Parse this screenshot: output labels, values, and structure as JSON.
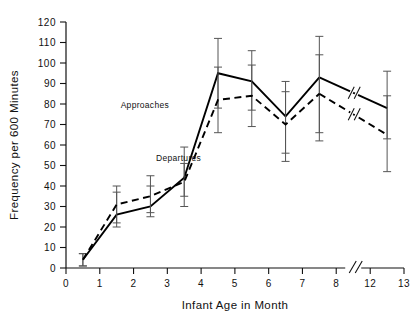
{
  "chart_data": {
    "type": "line",
    "title": "",
    "xlabel": "Infant Age in Month",
    "ylabel": "Frequency per 600 Minutes",
    "xlim": [
      0,
      13
    ],
    "ylim": [
      0,
      120
    ],
    "xticks": [
      "0",
      "1",
      "2",
      "3",
      "4",
      "5",
      "6",
      "7",
      "8",
      "12",
      "13"
    ],
    "xtick_values": [
      0,
      1,
      2,
      3,
      4,
      5,
      6,
      7,
      8,
      12,
      13
    ],
    "yticks": [
      "0",
      "10",
      "20",
      "30",
      "40",
      "50",
      "60",
      "70",
      "80",
      "90",
      "100",
      "110",
      "120"
    ],
    "ytick_values": [
      0,
      10,
      20,
      30,
      40,
      50,
      60,
      70,
      80,
      90,
      100,
      110,
      120
    ],
    "grid": false,
    "axis_break": {
      "after": 8,
      "before": 12,
      "label": "//"
    },
    "legend_position": "inline-annotation",
    "x": [
      0.5,
      1.5,
      2.5,
      3.5,
      4.5,
      5.5,
      6.5,
      7.5,
      12.5
    ],
    "series": [
      {
        "name": "Approaches",
        "style": "solid",
        "color": "#000000",
        "values": [
          4,
          26,
          30,
          44,
          95,
          91,
          74,
          93,
          78
        ],
        "err_low": [
          1,
          20,
          25,
          30,
          78,
          77,
          56,
          62,
          63
        ],
        "err_high": [
          7,
          37,
          40,
          59,
          112,
          106,
          91,
          113,
          96
        ]
      },
      {
        "name": "Departures",
        "style": "dashed",
        "color": "#000000",
        "values": [
          4,
          31,
          35,
          42,
          82,
          84,
          70,
          85,
          65
        ],
        "err_low": [
          1,
          22,
          27,
          35,
          66,
          69,
          52,
          66,
          47
        ],
        "err_high": [
          7,
          40,
          45,
          51,
          98,
          99,
          86,
          104,
          84
        ]
      }
    ],
    "annotations": [
      {
        "text": "Approaches",
        "x": 3.05,
        "y": 78
      },
      {
        "text": "Departures",
        "x": 4.0,
        "y": 52
      }
    ]
  }
}
